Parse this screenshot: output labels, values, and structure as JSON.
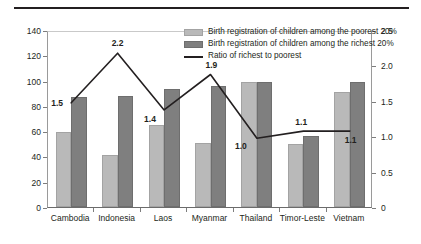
{
  "chart_data": {
    "type": "bar",
    "title": "",
    "subtitle": "",
    "xlabel": "",
    "ylabel": "",
    "categories": [
      "Cambodia",
      "Indonesia",
      "Laos",
      "Myanmar",
      "Thailand",
      "Timor-Leste",
      "Vietnam"
    ],
    "series": [
      {
        "name": "Birth registration of children among the poorest 20%",
        "type": "bar",
        "axis": "left",
        "color": "#b9b9b9",
        "values": [
          59,
          41,
          65,
          51,
          99,
          50,
          91
        ]
      },
      {
        "name": "Birth registration of children among the richest 20%",
        "type": "bar",
        "axis": "left",
        "color": "#7f7f7f",
        "values": [
          87,
          88,
          93,
          96,
          99,
          56,
          99
        ]
      },
      {
        "name": "Ratio of richest to poorest",
        "type": "line",
        "axis": "right",
        "color": "#231f20",
        "values": [
          1.5,
          2.2,
          1.4,
          1.9,
          1.0,
          1.1,
          1.1
        ],
        "labels": [
          "1.5",
          "2.2",
          "1.4",
          "1.9",
          "1.0",
          "1.1",
          "1.1"
        ]
      }
    ],
    "left_axis": {
      "ticks": [
        "0",
        "20",
        "40",
        "60",
        "80",
        "100",
        "120",
        "140"
      ],
      "min": 0,
      "max": 140
    },
    "right_axis": {
      "ticks": [
        "0",
        "0.5",
        "1.0",
        "1.5",
        "2.0",
        "2.5"
      ],
      "min": 0,
      "max": 2.5
    },
    "legend_position": "top-right",
    "grid": false
  }
}
